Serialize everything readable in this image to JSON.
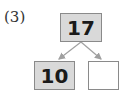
{
  "problem_label": "(3)",
  "number_bond": {
    "whole": "17",
    "parts": [
      "10",
      ""
    ]
  },
  "colors": {
    "filled_box": "#d9d9d9",
    "border": "#8a8a8a",
    "arrow": "#a0a0a0"
  }
}
